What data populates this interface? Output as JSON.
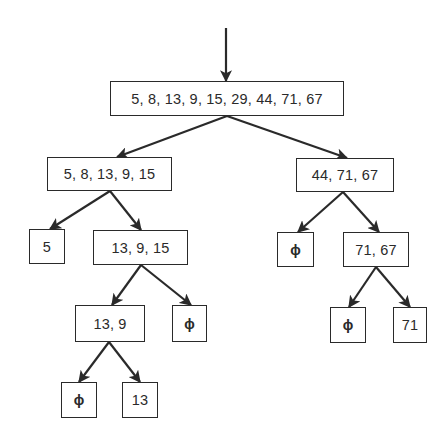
{
  "diagram": {
    "type": "binary-partition-tree",
    "line_color": "#2a2a2a",
    "background": "#ffffff",
    "empty_symbol": "ϕ",
    "entry_arrow": {
      "x": 226,
      "y1": 28,
      "y2": 81
    },
    "nodes": {
      "root": {
        "label": "5, 8, 13, 9, 15, 29, 44, 71, 67",
        "x": 110,
        "y": 81,
        "w": 234,
        "h": 35
      },
      "l": {
        "label": "5, 8, 13, 9, 15",
        "x": 47,
        "y": 157,
        "w": 125,
        "h": 34
      },
      "r": {
        "label": "44, 71, 67",
        "x": 296,
        "y": 158,
        "w": 98,
        "h": 34
      },
      "ll": {
        "label": "5",
        "x": 29,
        "y": 229,
        "w": 36,
        "h": 35
      },
      "lr": {
        "label": "13, 9, 15",
        "x": 93,
        "y": 230,
        "w": 95,
        "h": 35
      },
      "rl": {
        "label": "ϕ",
        "x": 277,
        "y": 232,
        "w": 37,
        "h": 35
      },
      "rr": {
        "label": "71, 67",
        "x": 343,
        "y": 232,
        "w": 66,
        "h": 35
      },
      "lrl": {
        "label": "13, 9",
        "x": 75,
        "y": 305,
        "w": 70,
        "h": 37
      },
      "lrr": {
        "label": "ϕ",
        "x": 172,
        "y": 305,
        "w": 35,
        "h": 37
      },
      "rrl": {
        "label": "ϕ",
        "x": 330,
        "y": 307,
        "w": 36,
        "h": 36
      },
      "rrr": {
        "label": "71",
        "x": 393,
        "y": 307,
        "w": 34,
        "h": 36
      },
      "lrll": {
        "label": "ϕ",
        "x": 61,
        "y": 382,
        "w": 36,
        "h": 36
      },
      "lrlr": {
        "label": "13",
        "x": 122,
        "y": 382,
        "w": 36,
        "h": 36
      }
    },
    "edges": [
      {
        "from": "root",
        "to": "l",
        "x1": 227,
        "y1": 116,
        "x2": 117,
        "y2": 157
      },
      {
        "from": "root",
        "to": "r",
        "x1": 227,
        "y1": 116,
        "x2": 347,
        "y2": 158
      },
      {
        "from": "l",
        "to": "ll",
        "x1": 110,
        "y1": 191,
        "x2": 50,
        "y2": 229
      },
      {
        "from": "l",
        "to": "lr",
        "x1": 110,
        "y1": 191,
        "x2": 141,
        "y2": 230
      },
      {
        "from": "r",
        "to": "rl",
        "x1": 343,
        "y1": 192,
        "x2": 298,
        "y2": 232
      },
      {
        "from": "r",
        "to": "rr",
        "x1": 343,
        "y1": 192,
        "x2": 379,
        "y2": 232
      },
      {
        "from": "lr",
        "to": "lrl",
        "x1": 141,
        "y1": 265,
        "x2": 112,
        "y2": 305
      },
      {
        "from": "lr",
        "to": "lrr",
        "x1": 141,
        "y1": 265,
        "x2": 191,
        "y2": 305
      },
      {
        "from": "rr",
        "to": "rrl",
        "x1": 376,
        "y1": 267,
        "x2": 349,
        "y2": 307
      },
      {
        "from": "rr",
        "to": "rrr",
        "x1": 376,
        "y1": 267,
        "x2": 410,
        "y2": 307
      },
      {
        "from": "lrl",
        "to": "lrll",
        "x1": 109,
        "y1": 342,
        "x2": 79,
        "y2": 382
      },
      {
        "from": "lrl",
        "to": "lrlr",
        "x1": 109,
        "y1": 342,
        "x2": 140,
        "y2": 382
      }
    ]
  }
}
